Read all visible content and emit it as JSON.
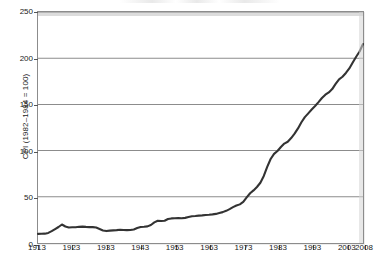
{
  "chart_data": {
    "type": "line",
    "title": "",
    "subtitle": "",
    "xlabel": "",
    "ylabel": "CPI (1982–1984 = 100)",
    "xlim": [
      1913,
      2008
    ],
    "ylim": [
      0,
      250
    ],
    "yticks": [
      0,
      50,
      100,
      150,
      200,
      250
    ],
    "xticks": [
      1913,
      1923,
      1933,
      1943,
      1953,
      1963,
      1973,
      1983,
      1993,
      2003,
      2008
    ],
    "grid": "horizontal",
    "legend": "none",
    "line_color": "#333333",
    "series": [
      {
        "name": "Consumer Price Index",
        "x": [
          1913,
          1914,
          1915,
          1916,
          1917,
          1918,
          1919,
          1920,
          1921,
          1922,
          1923,
          1924,
          1925,
          1926,
          1927,
          1928,
          1929,
          1930,
          1931,
          1932,
          1933,
          1934,
          1935,
          1936,
          1937,
          1938,
          1939,
          1940,
          1941,
          1942,
          1943,
          1944,
          1945,
          1946,
          1947,
          1948,
          1949,
          1950,
          1951,
          1952,
          1953,
          1954,
          1955,
          1956,
          1957,
          1958,
          1959,
          1960,
          1961,
          1962,
          1963,
          1964,
          1965,
          1966,
          1967,
          1968,
          1969,
          1970,
          1971,
          1972,
          1973,
          1974,
          1975,
          1976,
          1977,
          1978,
          1979,
          1980,
          1981,
          1982,
          1983,
          1984,
          1985,
          1986,
          1987,
          1988,
          1989,
          1990,
          1991,
          1992,
          1993,
          1994,
          1995,
          1996,
          1997,
          1998,
          1999,
          2000,
          2001,
          2002,
          2003,
          2004,
          2005,
          2006,
          2007,
          2008
        ],
        "values": [
          9.9,
          10.0,
          10.1,
          10.9,
          12.8,
          15.1,
          17.3,
          20.0,
          17.9,
          16.8,
          17.1,
          17.1,
          17.5,
          17.7,
          17.4,
          17.2,
          17.2,
          16.7,
          15.2,
          13.6,
          12.9,
          13.4,
          13.7,
          13.9,
          14.4,
          14.1,
          13.9,
          14.0,
          14.7,
          16.3,
          17.3,
          17.6,
          18.0,
          19.5,
          22.3,
          24.0,
          23.8,
          24.1,
          26.0,
          26.6,
          26.8,
          26.9,
          26.8,
          27.2,
          28.1,
          28.9,
          29.2,
          29.6,
          29.9,
          30.3,
          30.6,
          31.0,
          31.5,
          32.5,
          33.4,
          34.8,
          36.7,
          38.8,
          40.5,
          41.8,
          44.4,
          49.3,
          53.8,
          56.9,
          60.6,
          65.2,
          72.6,
          82.4,
          90.9,
          96.5,
          99.6,
          103.9,
          107.6,
          109.6,
          113.6,
          118.3,
          124.0,
          130.7,
          136.2,
          140.3,
          144.5,
          148.2,
          152.4,
          156.9,
          160.5,
          163.0,
          166.6,
          172.2,
          177.1,
          179.9,
          184.0,
          188.9,
          195.3,
          201.6,
          207.3,
          215.3
        ]
      }
    ]
  },
  "axes": {
    "y_title": "CPI (1982–1984 = 100)",
    "y_tick_labels": [
      "250",
      "200",
      "150",
      "100",
      "50",
      "0"
    ],
    "x_tick_labels": [
      "1913",
      "1923",
      "1933",
      "1943",
      "1953",
      "1963",
      "1973",
      "1983",
      "1993",
      "2003",
      "2008"
    ]
  }
}
